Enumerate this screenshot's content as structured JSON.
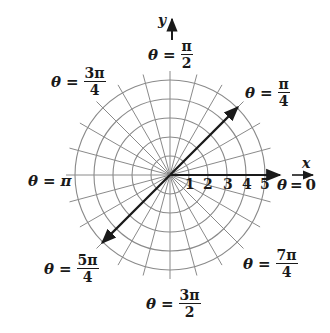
{
  "diagram": {
    "center": [
      170,
      175
    ],
    "circle_radii": [
      19,
      38,
      57,
      76,
      95
    ],
    "radial_line_count": 24,
    "radial_line_length": 104,
    "grid_color": "#8a8a8a",
    "ink_color": "#1a1a1a",
    "axes": {
      "x_label": "x",
      "y_label": "y"
    },
    "radius_ticks": [
      "1",
      "2",
      "3",
      "4",
      "5"
    ],
    "vectors": [
      {
        "name": "ray-pi-over-4",
        "angle_deg": 45,
        "length": 96
      },
      {
        "name": "ray-5pi-over-4",
        "angle_deg": 225,
        "length": 96
      },
      {
        "name": "ray-0",
        "angle_deg": 0,
        "length": 110
      }
    ],
    "angle_labels": [
      {
        "key": "pi_over_2",
        "theta": "θ",
        "eq": "=",
        "num": "π",
        "den": "2"
      },
      {
        "key": "3pi_over_4",
        "theta": "θ",
        "eq": "=",
        "num": "3π",
        "den": "4"
      },
      {
        "key": "pi_over_4",
        "theta": "θ",
        "eq": "=",
        "num": "π",
        "den": "4"
      },
      {
        "key": "pi",
        "theta": "θ",
        "eq": "=",
        "value": "π"
      },
      {
        "key": "zero",
        "theta": "θ",
        "eq": "=",
        "value": "0"
      },
      {
        "key": "5pi_over_4",
        "theta": "θ",
        "eq": "=",
        "num": "5π",
        "den": "4"
      },
      {
        "key": "7pi_over_4",
        "theta": "θ",
        "eq": "=",
        "num": "7π",
        "den": "4"
      },
      {
        "key": "3pi_over_2",
        "theta": "θ",
        "eq": "=",
        "num": "3π",
        "den": "2"
      }
    ]
  }
}
